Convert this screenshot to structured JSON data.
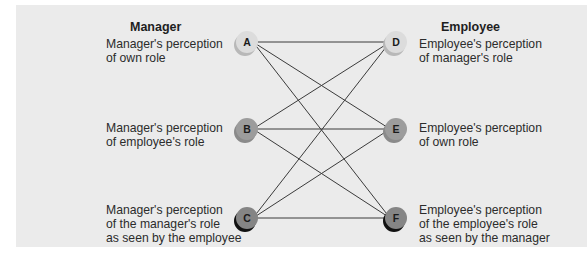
{
  "diagram": {
    "left_heading": "Manager",
    "right_heading": "Employee",
    "left_nodes": [
      {
        "id": "A",
        "label": "Manager's perception\nof own role",
        "fill": "#dcdcdc",
        "shadow": "#b8b8b8"
      },
      {
        "id": "B",
        "label": "Manager's perception\nof employee's role",
        "fill": "#9c9c9c",
        "shadow": "#8a8a8a"
      },
      {
        "id": "C",
        "label": "Manager's perception\nof the manager's role\nas seen by the employee",
        "fill": "#858585",
        "shadow": "#111111"
      }
    ],
    "right_nodes": [
      {
        "id": "D",
        "label": "Employee's perception\nof manager's role",
        "fill": "#dcdcdc",
        "shadow": "#b8b8b8"
      },
      {
        "id": "E",
        "label": "Employee's perception\nof own role",
        "fill": "#9c9c9c",
        "shadow": "#8a8a8a"
      },
      {
        "id": "F",
        "label": "Employee's perception\nof the employee's role\nas seen by the manager",
        "fill": "#858585",
        "shadow": "#111111"
      }
    ],
    "connections": [
      [
        "A",
        "D"
      ],
      [
        "A",
        "E"
      ],
      [
        "A",
        "F"
      ],
      [
        "B",
        "D"
      ],
      [
        "B",
        "E"
      ],
      [
        "B",
        "F"
      ],
      [
        "C",
        "D"
      ],
      [
        "C",
        "E"
      ],
      [
        "C",
        "F"
      ]
    ],
    "colors": {
      "panel_background": "#ebebeb",
      "line": "#3a3a3a"
    }
  }
}
